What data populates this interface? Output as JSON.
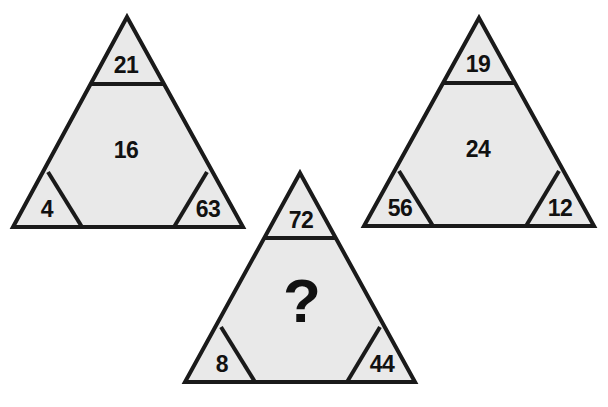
{
  "puzzle": {
    "type": "triangle-number-puzzle",
    "background_color": "#ffffff",
    "fill_color": "#e9e9e9",
    "line_color": "#1a1a1a",
    "text_color": "#111111",
    "unknown_symbol": "?",
    "triangles": [
      {
        "id": "left",
        "position": "top-left",
        "top": "21",
        "middle": "16",
        "bottom_left": "4",
        "bottom_right": "63"
      },
      {
        "id": "right",
        "position": "top-right",
        "top": "19",
        "middle": "24",
        "bottom_left": "56",
        "bottom_right": "12"
      },
      {
        "id": "bottom",
        "position": "bottom-center",
        "top": "72",
        "middle": "?",
        "bottom_left": "8",
        "bottom_right": "44"
      }
    ]
  }
}
